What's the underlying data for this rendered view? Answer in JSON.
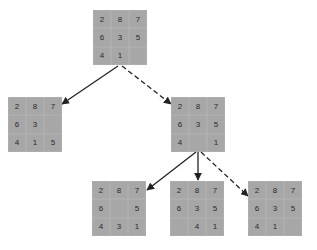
{
  "diagram": {
    "type": "search-tree",
    "nodes": [
      {
        "id": "root",
        "x": 93,
        "y": 10,
        "cells": [
          "2",
          "8",
          "7",
          "6",
          "3",
          "5",
          "4",
          "1",
          ""
        ]
      },
      {
        "id": "left",
        "x": 8,
        "y": 97,
        "cells": [
          "2",
          "8",
          "7",
          "6",
          "3",
          "",
          "4",
          "1",
          "5"
        ]
      },
      {
        "id": "right",
        "x": 171,
        "y": 97,
        "cells": [
          "2",
          "8",
          "7",
          "6",
          "3",
          "5",
          "4",
          "",
          "1"
        ]
      },
      {
        "id": "bottom-left",
        "x": 92,
        "y": 181,
        "cells": [
          "2",
          "8",
          "7",
          "6",
          "",
          "5",
          "4",
          "3",
          "1"
        ]
      },
      {
        "id": "bottom-middle",
        "x": 170,
        "y": 181,
        "cells": [
          "2",
          "8",
          "7",
          "6",
          "3",
          "5",
          "",
          "4",
          "1"
        ]
      },
      {
        "id": "bottom-right",
        "x": 248,
        "y": 181,
        "cells": [
          "2",
          "8",
          "7",
          "6",
          "3",
          "5",
          "4",
          "1",
          ""
        ]
      }
    ],
    "edges": [
      {
        "from": "root",
        "to": "left",
        "style": "solid",
        "x1": 118,
        "y1": 66,
        "x2": 62,
        "y2": 104
      },
      {
        "from": "root",
        "to": "right",
        "style": "dashed",
        "x1": 122,
        "y1": 66,
        "x2": 171,
        "y2": 104
      },
      {
        "from": "right",
        "to": "bottom-left",
        "style": "solid",
        "x1": 196,
        "y1": 152,
        "x2": 147,
        "y2": 190
      },
      {
        "from": "right",
        "to": "bottom-middle",
        "style": "solid",
        "x1": 198,
        "y1": 152,
        "x2": 198,
        "y2": 180
      },
      {
        "from": "right",
        "to": "bottom-right",
        "style": "dashed",
        "x1": 201,
        "y1": 152,
        "x2": 248,
        "y2": 196
      }
    ],
    "colors": {
      "tile": "#a7a7a7",
      "text": "#2a2a2a",
      "edge": "#222222"
    }
  }
}
